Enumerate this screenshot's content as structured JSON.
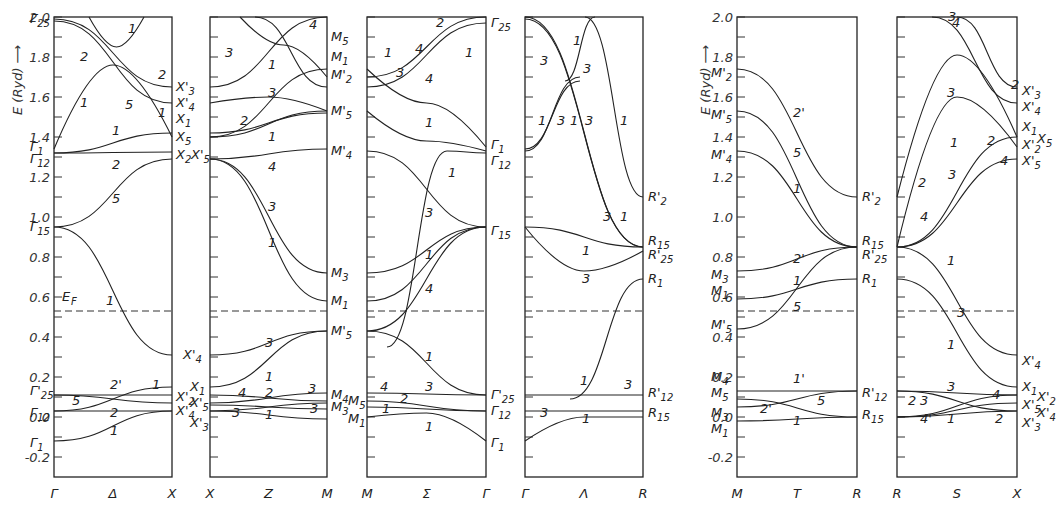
{
  "chart_data": {
    "type": "line",
    "title": "",
    "ylabel": "E (Ryd)",
    "ylim": [
      -0.3,
      2.0
    ],
    "yticks": [
      -0.2,
      0.0,
      0.2,
      0.4,
      0.6,
      0.8,
      1.0,
      1.2,
      1.4,
      1.6,
      1.8,
      2.0
    ],
    "fermi_level": {
      "label": "E_F",
      "value": 0.53
    },
    "grid": false,
    "panels": [
      {
        "name": "Gamma-Delta-X",
        "xticks": [
          "Γ",
          "Δ",
          "X"
        ],
        "left_labels": [
          "Γ25",
          "Γ1",
          "Γ12",
          "Γ15",
          "Γ'25",
          "Γ12",
          "Γ1"
        ],
        "right_labels": [
          "X'3",
          "X'4",
          "X1",
          "X5",
          "X2",
          "X'5",
          "X'4",
          "X'2",
          "X'4"
        ],
        "branch_labels": [
          "1",
          "2",
          "1",
          "5",
          "2",
          "1",
          "2",
          "5",
          "1",
          "2'",
          "1",
          "5",
          "2",
          "1"
        ]
      },
      {
        "name": "X-Z-M",
        "xticks": [
          "X",
          "Z",
          "M"
        ],
        "left_labels": [
          "X'3",
          "X'4",
          "X1",
          "X5",
          "X2",
          "X'5",
          "X'4",
          "X1",
          "X'5",
          "X'3"
        ],
        "right_labels": [
          "M5",
          "M1",
          "M'2",
          "M'5",
          "M'4",
          "M3",
          "M1",
          "M'5",
          "M4",
          "M3"
        ],
        "branch_labels": [
          "4",
          "3",
          "1",
          "3",
          "2",
          "1",
          "4",
          "3",
          "1",
          "3",
          "1",
          "4",
          "2",
          "3",
          "3",
          "1",
          "3"
        ]
      },
      {
        "name": "M-Sigma-Gamma",
        "xticks": [
          "M",
          "Σ",
          "Γ"
        ],
        "left_labels": [
          "M5",
          "M1",
          "M'2",
          "M'5",
          "M'4",
          "M3",
          "M1",
          "M'5",
          "M5",
          "M1"
        ],
        "right_labels": [
          "Γ25",
          "Γ1",
          "Γ12",
          "Γ15",
          "Γ'25",
          "Γ12",
          "Γ1"
        ],
        "branch_labels": [
          "2",
          "1",
          "4",
          "1",
          "3",
          "4",
          "1",
          "1",
          "3",
          "1",
          "4",
          "1",
          "4",
          "2",
          "3",
          "1",
          "1"
        ]
      },
      {
        "name": "Gamma-Lambda-R",
        "xticks": [
          "Γ",
          "Λ",
          "R"
        ],
        "left_labels": [
          "Γ25",
          "Γ1",
          "Γ12",
          "Γ15",
          "Γ'25",
          "Γ12",
          "Γ1"
        ],
        "right_labels": [
          "R'2",
          "R15",
          "R'25",
          "R1",
          "R'12",
          "R15"
        ],
        "branch_labels": [
          "1",
          "3",
          "3",
          "1",
          "3",
          "1",
          "3",
          "1",
          "3",
          "1",
          "1",
          "3",
          "1",
          "3",
          "3",
          "1"
        ]
      },
      {
        "name": "M-T-R",
        "xticks": [
          "M",
          "T",
          "R"
        ],
        "left_labels": [
          "M'2",
          "M'5",
          "M'4",
          "M3",
          "M1",
          "M'5",
          "M4",
          "M5",
          "M3",
          "M1"
        ],
        "right_labels": [
          "R'2",
          "R15",
          "R'25",
          "R1",
          "R'12",
          "R15"
        ],
        "branch_labels": [
          "2'",
          "5",
          "1",
          "2'",
          "1",
          "5",
          "1'",
          "5",
          "2'",
          "1"
        ]
      },
      {
        "name": "R-S-X",
        "xticks": [
          "R",
          "S",
          "X"
        ],
        "left_labels": [],
        "right_labels": [
          "X'3",
          "X'4",
          "X1",
          "X5",
          "X'2",
          "X'5",
          "X'4",
          "X1",
          "X'2",
          "X'5",
          "X'4",
          "X'3"
        ],
        "branch_labels": [
          "3",
          "4",
          "2",
          "3",
          "1",
          "2",
          "3",
          "4",
          "2",
          "4",
          "1",
          "4",
          "3",
          "1",
          "3",
          "4",
          "2",
          "3",
          "4'",
          "1",
          "2"
        ]
      }
    ]
  }
}
